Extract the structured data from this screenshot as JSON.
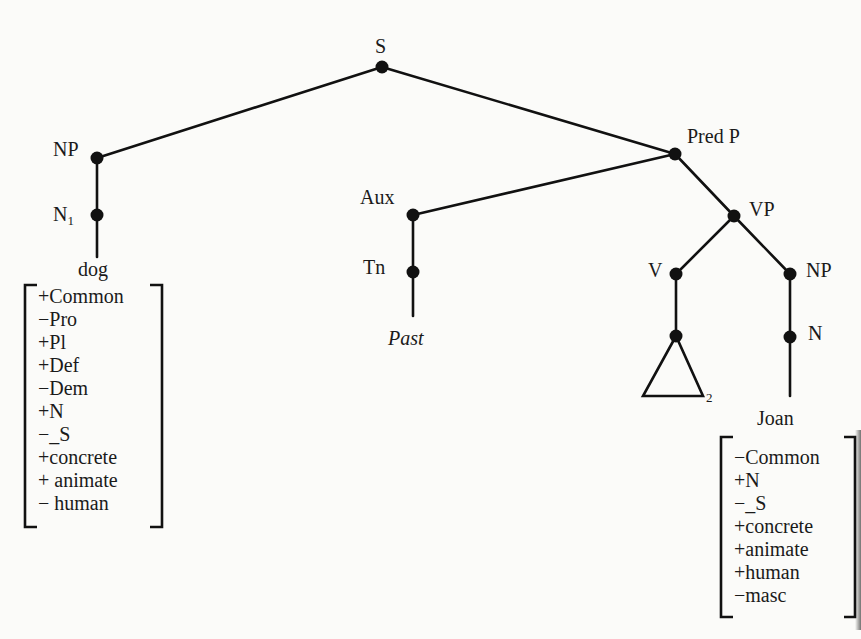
{
  "diagram": {
    "type": "syntactic-phrase-structure-tree",
    "nodes": {
      "S": "S",
      "NP_subject": "NP",
      "N1_base": "N",
      "N1_sub": "1",
      "PredP": "Pred P",
      "Aux": "Aux",
      "Tn": "Tn",
      "VP": "VP",
      "V": "V",
      "NP_object": "NP",
      "N_object": "N",
      "triangle_sub": "2"
    },
    "terminals": {
      "subject_noun": "dog",
      "tense": "Past",
      "object_noun": "Joan"
    },
    "features": {
      "dog": [
        "+Common",
        "−Pro",
        "+Pl",
        "+Def",
        "−Dem",
        "+N",
        "−_S",
        "+concrete",
        "+ animate",
        "− human"
      ],
      "joan": [
        "−Common",
        "+N",
        "−_S",
        "+concrete",
        "+animate",
        "+human",
        "−masc"
      ]
    }
  }
}
